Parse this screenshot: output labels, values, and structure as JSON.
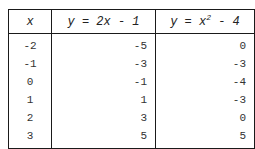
{
  "table": {
    "headers": [
      {
        "label": "x"
      },
      {
        "prefix": "y = 2x - 1"
      },
      {
        "prefix": "y = x",
        "sup": "2",
        "suffix": " - 4"
      }
    ],
    "rows": [
      {
        "x": "-2",
        "y1": "-5",
        "y2": "0"
      },
      {
        "x": "-1",
        "y1": "-3",
        "y2": "-3"
      },
      {
        "x": "0",
        "y1": "-1",
        "y2": "-4"
      },
      {
        "x": "1",
        "y1": "1",
        "y2": "-3"
      },
      {
        "x": "2",
        "y1": "3",
        "y2": "0"
      },
      {
        "x": "3",
        "y1": "5",
        "y2": "5"
      }
    ]
  }
}
